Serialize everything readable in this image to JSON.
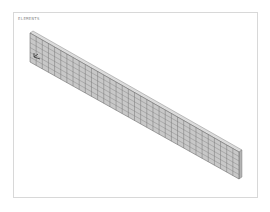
{
  "plot": {
    "label": "ELEMENTS",
    "background": "#ffffff",
    "frame_color": "#d8d8d8"
  },
  "model": {
    "description": "Meshed beam/plate in isometric view",
    "fill_color": "#c8c8c8",
    "mesh_line_color": "#6e6e6e",
    "edge_color": "#555555",
    "mesh_columns": 34,
    "mesh_rows": 6,
    "corners": {
      "top_left": [
        30,
        33
      ],
      "bottom_left": [
        30,
        62
      ],
      "top_right": [
        239,
        152
      ],
      "bottom_right": [
        239,
        179
      ]
    },
    "triad_marker": {
      "position": [
        34,
        57
      ],
      "color": "#333333"
    }
  }
}
